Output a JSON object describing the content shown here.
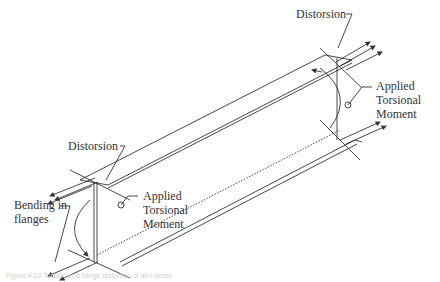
{
  "diagram": {
    "type": "structural-mechanics",
    "labels": {
      "distorsion_right": "Distorsion",
      "distorsion_left": "Distorsion",
      "torsion_right_line1": "Applied",
      "torsion_right_line2": "Torsional",
      "torsion_right_line3": "Moment",
      "torsion_left_line1": "Applied",
      "torsion_left_line2": "Torsional",
      "torsion_left_line3": "Moment",
      "bending_line1": "Bending in",
      "bending_line2": "flanges"
    },
    "caption": "Figure 4.10  Torsion and flange distortion of an I-beam",
    "colors": {
      "line": "#333333",
      "text": "#333333",
      "caption": "#cfcfcf",
      "background": "#ffffff"
    }
  }
}
